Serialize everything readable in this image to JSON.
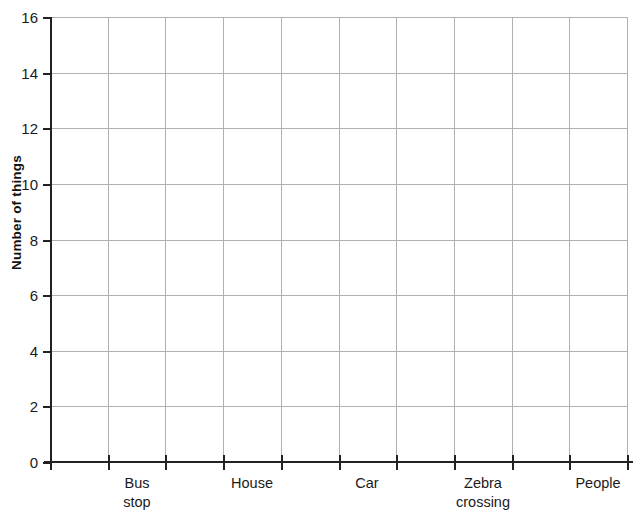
{
  "chart_data": {
    "type": "bar",
    "title": "",
    "xlabel": "",
    "ylabel": "Number of things",
    "categories": [
      "Bus stop",
      "House",
      "Car",
      "Zebra crossing",
      "People"
    ],
    "values": [
      null,
      null,
      null,
      null,
      null
    ],
    "series": [
      {
        "name": "Number of things",
        "values": [
          null,
          null,
          null,
          null,
          null
        ]
      }
    ],
    "ylim": [
      0,
      16
    ],
    "y_ticks": [
      0,
      2,
      4,
      6,
      8,
      10,
      12,
      14,
      16
    ],
    "y_tick_labels": [
      "0",
      "2",
      "4",
      "6",
      "8",
      "10",
      "12",
      "14",
      "16"
    ],
    "grid": true,
    "grid_columns": 10,
    "legend": "none"
  },
  "axes": {
    "y_title": "Number of things",
    "y_tick_labels": [
      "16",
      "14",
      "12",
      "10",
      "8",
      "6",
      "4",
      "2",
      "0"
    ],
    "x_category_labels": [
      "Bus\nstop",
      "House",
      "Car",
      "Zebra\ncrossing",
      "People"
    ]
  },
  "colors": {
    "grid": "#b0b0b0",
    "axis": "#222222",
    "text": "#1a1a1a",
    "background": "#ffffff"
  }
}
